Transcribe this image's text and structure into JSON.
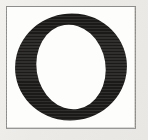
{
  "document": {
    "kind": "letter-specimen",
    "caption": "O",
    "character": "O",
    "case": "uppercase",
    "style": "serif",
    "description": "Printed capital letter O inside a thin ruled rectangular frame"
  },
  "canvas": {
    "width": 148,
    "height": 140,
    "background_color": "#edece9"
  },
  "frame": {
    "x": 6,
    "y": 6,
    "width": 130,
    "height": 123,
    "border_color": "#8d8d8c",
    "border_width": 1,
    "fill_color": "#fdfdfc"
  },
  "glyph": {
    "character": "O",
    "ink_color": "#1b1a19",
    "bounds": {
      "x": 10,
      "y": 6,
      "width": 112,
      "height": 108
    },
    "outer_center_x": 66,
    "outer_center_y": 60,
    "outer_radius_x": 56,
    "outer_radius_y": 54,
    "counter_center_x": 66,
    "counter_center_y": 60,
    "counter_radius_x": 35,
    "counter_radius_y": 43,
    "axis_tilt_degrees": -9,
    "stroke_thick_px": 22,
    "stroke_thin_px": 11
  }
}
